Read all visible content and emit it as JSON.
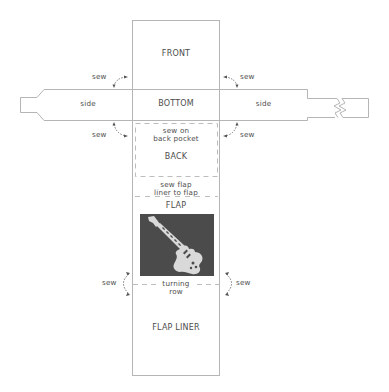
{
  "diagram": {
    "panels": {
      "front": "FRONT",
      "bottom": "BOTTOM",
      "side_left": "side",
      "side_right": "side",
      "back": "BACK",
      "back_note_line1": "sew on",
      "back_note_line2": "back pocket",
      "flap_note_line1": "sew flap",
      "flap_note_line2": "liner to flap",
      "flap": "FLAP",
      "turning_line1": "turning",
      "turning_line2": "row",
      "flap_liner": "FLAP LINER"
    },
    "sew_labels": {
      "top_left": "sew",
      "top_right": "sew",
      "mid_left": "sew",
      "mid_right": "sew",
      "low_left": "sew",
      "low_right": "sew"
    },
    "image": {
      "icon": "electric-guitar-icon",
      "background": "#4b4b4b",
      "foreground": "#d9d9d9"
    },
    "colors": {
      "outline": "#b5b5b5",
      "dashed": "#bdbdbd",
      "text": "#4d4d4d"
    }
  }
}
